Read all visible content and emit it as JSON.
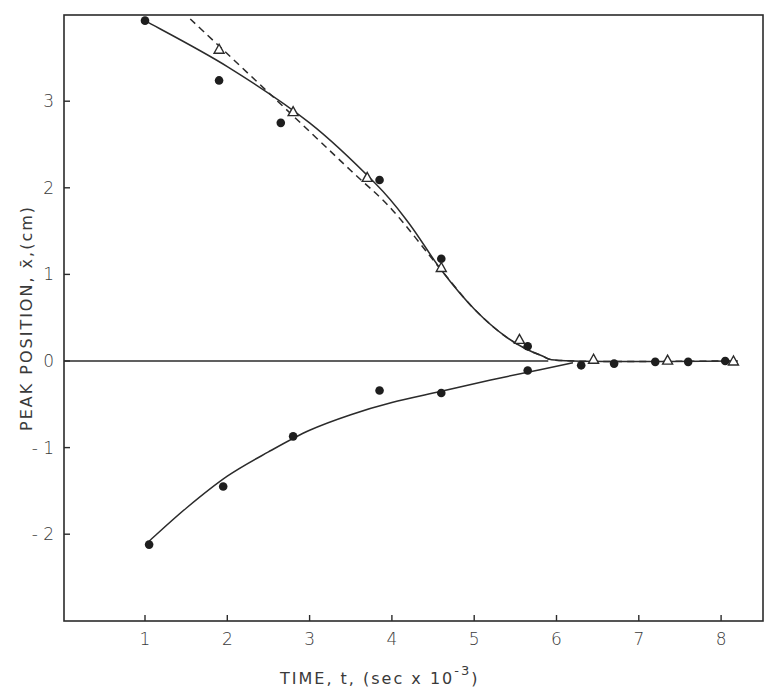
{
  "chart_data": {
    "type": "scatter",
    "title": "",
    "xlabel": "TIME, t, (sec x 10",
    "xlabel_exponent": "-3",
    "xlabel_close": ")",
    "ylabel": "PEAK POSITION, x̄,(cm)",
    "xlim": [
      0,
      8.5
    ],
    "ylim": [
      -3.0,
      4.0
    ],
    "grid": false,
    "legend": "none",
    "x_ticks": [
      "1",
      "2",
      "3",
      "4",
      "5",
      "6",
      "7",
      "8"
    ],
    "y_ticks": [
      "3",
      "2",
      "1",
      "0",
      "-1",
      "-2"
    ],
    "reference_line": {
      "name": "zero line",
      "y": 0,
      "x_from": 0,
      "x_to": 5.9
    },
    "series": [
      {
        "name": "upper branch (filled circles)",
        "marker": "filled-circle",
        "points": [
          [
            1.0,
            3.93
          ],
          [
            1.9,
            3.24
          ],
          [
            2.65,
            2.75
          ],
          [
            3.85,
            2.09
          ],
          [
            4.6,
            1.18
          ],
          [
            5.65,
            0.17
          ],
          [
            6.3,
            -0.05
          ],
          [
            6.7,
            -0.03
          ],
          [
            7.2,
            -0.01
          ],
          [
            7.6,
            -0.01
          ],
          [
            8.05,
            0.0
          ]
        ]
      },
      {
        "name": "upper branch (open triangles)",
        "marker": "open-triangle",
        "points": [
          [
            1.9,
            3.6
          ],
          [
            2.8,
            2.88
          ],
          [
            3.7,
            2.12
          ],
          [
            4.6,
            1.08
          ],
          [
            5.55,
            0.25
          ],
          [
            6.45,
            0.02
          ],
          [
            7.35,
            0.01
          ],
          [
            8.15,
            0.0
          ]
        ]
      },
      {
        "name": "lower branch (filled circles)",
        "marker": "filled-circle",
        "points": [
          [
            1.05,
            -2.12
          ],
          [
            1.95,
            -1.45
          ],
          [
            2.8,
            -0.87
          ],
          [
            3.85,
            -0.34
          ],
          [
            4.6,
            -0.37
          ],
          [
            5.65,
            -0.11
          ]
        ]
      },
      {
        "name": "upper fit (solid)",
        "style": "solid",
        "points": [
          [
            1.0,
            3.93
          ],
          [
            2.0,
            3.4
          ],
          [
            3.0,
            2.75
          ],
          [
            3.8,
            2.05
          ],
          [
            4.2,
            1.6
          ],
          [
            4.6,
            1.05
          ],
          [
            5.0,
            0.6
          ],
          [
            5.4,
            0.27
          ],
          [
            5.8,
            0.07
          ],
          [
            6.2,
            0.0
          ],
          [
            8.2,
            0.0
          ]
        ]
      },
      {
        "name": "upper fit (dashed)",
        "style": "dashed",
        "points": [
          [
            1.55,
            3.95
          ],
          [
            2.5,
            3.1
          ],
          [
            3.5,
            2.2
          ],
          [
            4.0,
            1.75
          ],
          [
            4.6,
            1.05
          ],
          [
            5.0,
            0.6
          ],
          [
            5.4,
            0.27
          ],
          [
            5.8,
            0.07
          ],
          [
            6.2,
            0.0
          ],
          [
            8.2,
            0.0
          ]
        ]
      },
      {
        "name": "lower fit (solid)",
        "style": "solid",
        "points": [
          [
            1.05,
            -2.08
          ],
          [
            1.5,
            -1.7
          ],
          [
            2.0,
            -1.33
          ],
          [
            2.5,
            -1.05
          ],
          [
            3.0,
            -0.8
          ],
          [
            3.5,
            -0.62
          ],
          [
            4.0,
            -0.48
          ],
          [
            4.6,
            -0.35
          ],
          [
            5.2,
            -0.22
          ],
          [
            5.8,
            -0.1
          ],
          [
            6.2,
            -0.02
          ]
        ]
      }
    ]
  }
}
